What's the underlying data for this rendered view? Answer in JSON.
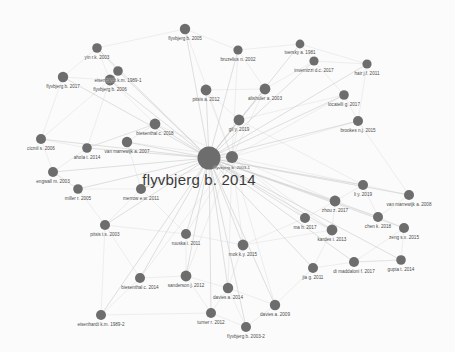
{
  "graph": {
    "type": "network",
    "title": "flyvbjerg b. 2014",
    "node_color": "#6d6d6d",
    "edge_color": "#cfcfcf",
    "label_color": "#4a4a4a",
    "background": "#fbfbfb",
    "center_label": "flyvbjerg b. 2014",
    "nodes": [
      {
        "id": 0,
        "label": "flyvbjerg b. 2014",
        "x": 209,
        "y": 158,
        "r": 11.5,
        "fs": 4.6,
        "ly": 9,
        "main": true
      },
      {
        "id": 1,
        "label": "flyvbjerg b. 2003-1",
        "x": 232,
        "y": 157,
        "r": 6.0,
        "fs": 4.4,
        "ly": 6
      },
      {
        "id": 2,
        "label": "flyvbjerg b. 2005",
        "x": 185,
        "y": 29,
        "r": 5.2,
        "fs": 4.6,
        "ly": 6
      },
      {
        "id": 3,
        "label": "yin r.k. 2003",
        "x": 97,
        "y": 48,
        "r": 4.8,
        "fs": 4.6,
        "ly": 6
      },
      {
        "id": 4,
        "label": "bruzelius n. 2002",
        "x": 238,
        "y": 50,
        "r": 4.6,
        "fs": 4.6,
        "ly": 6
      },
      {
        "id": 5,
        "label": "tversky a. 1981",
        "x": 300,
        "y": 44,
        "r": 4.4,
        "fs": 4.6,
        "ly": 6
      },
      {
        "id": 6,
        "label": "invernizzi d.c. 2017",
        "x": 314,
        "y": 61,
        "r": 4.6,
        "fs": 4.6,
        "ly": 6
      },
      {
        "id": 7,
        "label": "hair j.f. 2011",
        "x": 367,
        "y": 64,
        "r": 4.6,
        "fs": 4.6,
        "ly": 6
      },
      {
        "id": 8,
        "label": "eisenhardt k.m. 1989-1",
        "x": 118,
        "y": 71,
        "r": 4.8,
        "fs": 4.6,
        "ly": 6
      },
      {
        "id": 9,
        "label": "flyvbjerg b. 2017",
        "x": 63,
        "y": 77,
        "r": 5.2,
        "fs": 4.6,
        "ly": 6
      },
      {
        "id": 10,
        "label": "flyvbjerg b. 2006",
        "x": 110,
        "y": 80,
        "r": 5.4,
        "fs": 4.6,
        "ly": 6
      },
      {
        "id": 11,
        "label": "pitsis a. 2012",
        "x": 206,
        "y": 90,
        "r": 5.4,
        "fs": 4.6,
        "ly": 6
      },
      {
        "id": 12,
        "label": "altshuler a. 2003",
        "x": 265,
        "y": 89,
        "r": 5.4,
        "fs": 4.6,
        "ly": 6
      },
      {
        "id": 13,
        "label": "locatelli g. 2017",
        "x": 344,
        "y": 95,
        "r": 4.8,
        "fs": 4.6,
        "ly": 6
      },
      {
        "id": 14,
        "label": "biesenthal c. 2018",
        "x": 155,
        "y": 124,
        "r": 5.4,
        "fs": 4.6,
        "ly": 6
      },
      {
        "id": 15,
        "label": "gil y. 2019",
        "x": 239,
        "y": 120,
        "r": 5.4,
        "fs": 4.6,
        "ly": 6
      },
      {
        "id": 16,
        "label": "brookes n.j. 2015",
        "x": 358,
        "y": 121,
        "r": 5.0,
        "fs": 4.6,
        "ly": 6
      },
      {
        "id": 17,
        "label": "cicmil s. 2006",
        "x": 41,
        "y": 139,
        "r": 5.0,
        "fs": 4.6,
        "ly": 6
      },
      {
        "id": 18,
        "label": "van marrewijk a. 2007",
        "x": 127,
        "y": 142,
        "r": 5.2,
        "fs": 4.6,
        "ly": 6
      },
      {
        "id": 19,
        "label": "ahola t. 2014",
        "x": 87,
        "y": 148,
        "r": 4.8,
        "fs": 4.6,
        "ly": 6
      },
      {
        "id": 20,
        "label": "engwall m. 2003",
        "x": 53,
        "y": 172,
        "r": 5.0,
        "fs": 4.6,
        "ly": 6
      },
      {
        "id": 21,
        "label": "miller r. 2005",
        "x": 78,
        "y": 189,
        "r": 4.8,
        "fs": 4.6,
        "ly": 6
      },
      {
        "id": 22,
        "label": "merrow e.w. 2011",
        "x": 141,
        "y": 189,
        "r": 5.0,
        "fs": 4.6,
        "ly": 6
      },
      {
        "id": 23,
        "label": "li y. 2019",
        "x": 363,
        "y": 185,
        "r": 5.0,
        "fs": 4.6,
        "ly": 6
      },
      {
        "id": 24,
        "label": "van marrewijk a. 2008",
        "x": 409,
        "y": 195,
        "r": 5.0,
        "fs": 4.6,
        "ly": 6
      },
      {
        "id": 25,
        "label": "zhou z. 2017",
        "x": 335,
        "y": 201,
        "r": 5.4,
        "fs": 4.6,
        "ly": 6
      },
      {
        "id": 26,
        "label": "pitsis t.s. 2003",
        "x": 105,
        "y": 225,
        "r": 5.0,
        "fs": 4.6,
        "ly": 6
      },
      {
        "id": 27,
        "label": "ma h. 2017",
        "x": 305,
        "y": 218,
        "r": 5.0,
        "fs": 4.6,
        "ly": 6
      },
      {
        "id": 28,
        "label": "chen k. 2018",
        "x": 378,
        "y": 217,
        "r": 5.0,
        "fs": 4.6,
        "ly": 6
      },
      {
        "id": 29,
        "label": "zeng s.x. 2015",
        "x": 404,
        "y": 228,
        "r": 5.0,
        "fs": 4.6,
        "ly": 6
      },
      {
        "id": 30,
        "label": "kardes i. 2013",
        "x": 332,
        "y": 230,
        "r": 5.4,
        "fs": 4.6,
        "ly": 6
      },
      {
        "id": 31,
        "label": "ruuska i. 2011",
        "x": 186,
        "y": 234,
        "r": 5.0,
        "fs": 4.6,
        "ly": 6
      },
      {
        "id": 32,
        "label": "mok k.y. 2015",
        "x": 243,
        "y": 245,
        "r": 5.4,
        "fs": 4.6,
        "ly": 6
      },
      {
        "id": 33,
        "label": "jia g. 2011",
        "x": 313,
        "y": 268,
        "r": 5.0,
        "fs": 4.6,
        "ly": 6
      },
      {
        "id": 34,
        "label": "di maddaloni f. 2017",
        "x": 354,
        "y": 262,
        "r": 5.0,
        "fs": 4.6,
        "ly": 6
      },
      {
        "id": 35,
        "label": "gupta t. 2014",
        "x": 401,
        "y": 260,
        "r": 4.8,
        "fs": 4.6,
        "ly": 6
      },
      {
        "id": 36,
        "label": "biesenthal c. 2014",
        "x": 140,
        "y": 278,
        "r": 5.0,
        "fs": 4.6,
        "ly": 6
      },
      {
        "id": 37,
        "label": "sanderson j. 2012",
        "x": 186,
        "y": 276,
        "r": 5.4,
        "fs": 4.6,
        "ly": 6
      },
      {
        "id": 38,
        "label": "davies a. 2014",
        "x": 228,
        "y": 288,
        "r": 5.2,
        "fs": 4.6,
        "ly": 6
      },
      {
        "id": 39,
        "label": "davies a. 2009",
        "x": 275,
        "y": 305,
        "r": 5.2,
        "fs": 4.6,
        "ly": 6
      },
      {
        "id": 40,
        "label": "eisenhardt k.m. 1989-2",
        "x": 101,
        "y": 315,
        "r": 5.0,
        "fs": 4.6,
        "ly": 6
      },
      {
        "id": 41,
        "label": "turner r. 2012",
        "x": 211,
        "y": 313,
        "r": 5.0,
        "fs": 4.6,
        "ly": 6
      },
      {
        "id": 42,
        "label": "flyvbjerg b. 2003-2",
        "x": 246,
        "y": 327,
        "r": 5.0,
        "fs": 4.6,
        "ly": 6
      }
    ],
    "edges": [
      [
        0,
        1
      ],
      [
        0,
        2
      ],
      [
        0,
        3
      ],
      [
        0,
        4
      ],
      [
        0,
        5
      ],
      [
        0,
        6
      ],
      [
        0,
        7
      ],
      [
        0,
        8
      ],
      [
        0,
        9
      ],
      [
        0,
        10
      ],
      [
        0,
        11
      ],
      [
        0,
        12
      ],
      [
        0,
        13
      ],
      [
        0,
        14
      ],
      [
        0,
        15
      ],
      [
        0,
        16
      ],
      [
        0,
        17
      ],
      [
        0,
        18
      ],
      [
        0,
        19
      ],
      [
        0,
        20
      ],
      [
        0,
        21
      ],
      [
        0,
        22
      ],
      [
        0,
        23
      ],
      [
        0,
        24
      ],
      [
        0,
        25
      ],
      [
        0,
        26
      ],
      [
        0,
        27
      ],
      [
        0,
        28
      ],
      [
        0,
        29
      ],
      [
        0,
        30
      ],
      [
        0,
        31
      ],
      [
        0,
        32
      ],
      [
        0,
        33
      ],
      [
        0,
        34
      ],
      [
        0,
        35
      ],
      [
        0,
        36
      ],
      [
        0,
        37
      ],
      [
        0,
        38
      ],
      [
        0,
        39
      ],
      [
        0,
        40
      ],
      [
        0,
        41
      ],
      [
        0,
        42
      ],
      [
        1,
        2
      ],
      [
        1,
        4
      ],
      [
        1,
        12
      ],
      [
        1,
        15
      ],
      [
        1,
        11
      ],
      [
        1,
        23
      ],
      [
        1,
        25
      ],
      [
        1,
        32
      ],
      [
        1,
        38
      ],
      [
        1,
        39
      ],
      [
        1,
        16
      ],
      [
        1,
        13
      ],
      [
        1,
        30
      ],
      [
        1,
        27
      ],
      [
        1,
        37
      ],
      [
        1,
        31
      ],
      [
        1,
        36
      ],
      [
        1,
        18
      ],
      [
        1,
        22
      ],
      [
        1,
        14
      ],
      [
        3,
        8
      ],
      [
        3,
        10
      ],
      [
        3,
        9
      ],
      [
        8,
        10
      ],
      [
        9,
        10
      ],
      [
        10,
        14
      ],
      [
        10,
        19
      ],
      [
        10,
        17
      ],
      [
        2,
        4
      ],
      [
        4,
        12
      ],
      [
        5,
        6
      ],
      [
        5,
        7
      ],
      [
        6,
        7
      ],
      [
        6,
        13
      ],
      [
        13,
        16
      ],
      [
        12,
        15
      ],
      [
        11,
        15
      ],
      [
        14,
        18
      ],
      [
        14,
        19
      ],
      [
        17,
        19
      ],
      [
        17,
        20
      ],
      [
        19,
        20
      ],
      [
        20,
        21
      ],
      [
        21,
        22
      ],
      [
        21,
        26
      ],
      [
        22,
        26
      ],
      [
        23,
        24
      ],
      [
        23,
        25
      ],
      [
        23,
        28
      ],
      [
        25,
        27
      ],
      [
        25,
        30
      ],
      [
        25,
        28
      ],
      [
        27,
        30
      ],
      [
        28,
        29
      ],
      [
        29,
        35
      ],
      [
        30,
        33
      ],
      [
        33,
        34
      ],
      [
        34,
        35
      ],
      [
        31,
        32
      ],
      [
        31,
        37
      ],
      [
        32,
        38
      ],
      [
        36,
        37
      ],
      [
        37,
        38
      ],
      [
        38,
        39
      ],
      [
        38,
        41
      ],
      [
        41,
        42
      ],
      [
        39,
        42
      ],
      [
        40,
        36
      ],
      [
        40,
        26
      ],
      [
        16,
        24
      ],
      [
        15,
        23
      ],
      [
        26,
        31
      ],
      [
        22,
        31
      ],
      [
        18,
        22
      ],
      [
        9,
        17
      ],
      [
        11,
        12
      ],
      [
        2,
        3
      ],
      [
        7,
        16
      ],
      [
        24,
        28
      ],
      [
        30,
        32
      ],
      [
        33,
        39
      ],
      [
        34,
        29
      ],
      [
        36,
        26
      ],
      [
        37,
        41
      ],
      [
        19,
        14
      ],
      [
        35,
        34
      ],
      [
        27,
        32
      ],
      [
        42,
        38
      ],
      [
        40,
        41
      ],
      [
        21,
        20
      ],
      [
        13,
        15
      ],
      [
        6,
        12
      ],
      [
        5,
        4
      ]
    ]
  }
}
